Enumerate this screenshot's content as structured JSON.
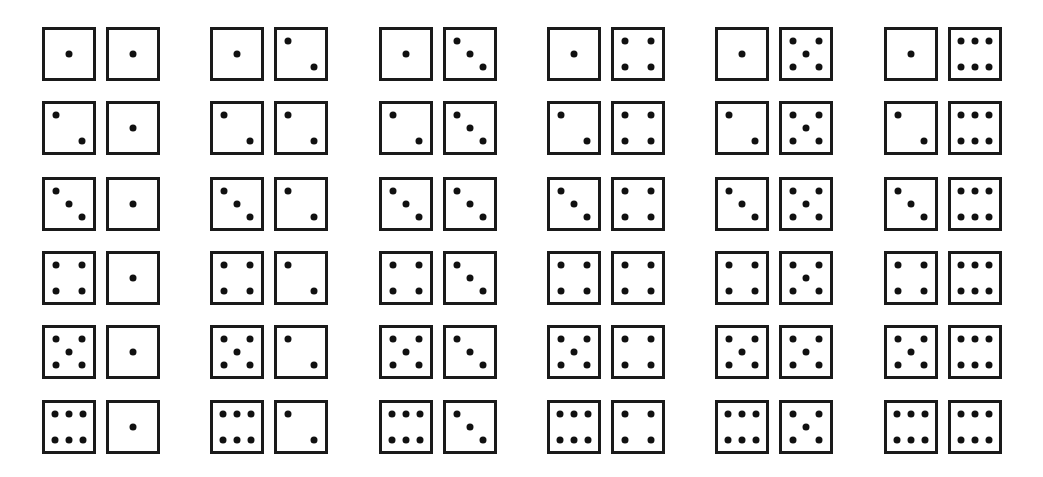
{
  "figure": {
    "rows": 6,
    "cols": 6,
    "ink_color": "#111111",
    "background": "#ffffff",
    "row_y": [
      27,
      101,
      177,
      251,
      325,
      400
    ],
    "col_x": [
      42,
      210,
      379,
      547,
      715,
      884
    ],
    "pairs": [
      [
        [
          1,
          1
        ],
        [
          1,
          2
        ],
        [
          1,
          3
        ],
        [
          1,
          4
        ],
        [
          1,
          5
        ],
        [
          1,
          6
        ]
      ],
      [
        [
          2,
          1
        ],
        [
          2,
          2
        ],
        [
          2,
          3
        ],
        [
          2,
          4
        ],
        [
          2,
          5
        ],
        [
          2,
          6
        ]
      ],
      [
        [
          3,
          1
        ],
        [
          3,
          2
        ],
        [
          3,
          3
        ],
        [
          3,
          4
        ],
        [
          3,
          5
        ],
        [
          3,
          6
        ]
      ],
      [
        [
          4,
          1
        ],
        [
          4,
          2
        ],
        [
          4,
          3
        ],
        [
          4,
          4
        ],
        [
          4,
          5
        ],
        [
          4,
          6
        ]
      ],
      [
        [
          5,
          1
        ],
        [
          5,
          2
        ],
        [
          5,
          3
        ],
        [
          5,
          4
        ],
        [
          5,
          5
        ],
        [
          5,
          6
        ]
      ],
      [
        [
          6,
          1
        ],
        [
          6,
          2
        ],
        [
          6,
          3
        ],
        [
          6,
          4
        ],
        [
          6,
          5
        ],
        [
          6,
          6
        ]
      ]
    ],
    "face_layouts": {
      "1": [
        [
          0.5,
          0.5
        ]
      ],
      "2": [
        [
          0.22,
          0.22
        ],
        [
          0.78,
          0.78
        ]
      ],
      "3": [
        [
          0.22,
          0.22
        ],
        [
          0.5,
          0.5
        ],
        [
          0.78,
          0.78
        ]
      ],
      "4": [
        [
          0.22,
          0.22
        ],
        [
          0.78,
          0.22
        ],
        [
          0.22,
          0.78
        ],
        [
          0.78,
          0.78
        ]
      ],
      "5": [
        [
          0.22,
          0.22
        ],
        [
          0.78,
          0.22
        ],
        [
          0.5,
          0.5
        ],
        [
          0.22,
          0.78
        ],
        [
          0.78,
          0.78
        ]
      ],
      "6": [
        [
          0.2,
          0.22
        ],
        [
          0.5,
          0.22
        ],
        [
          0.8,
          0.22
        ],
        [
          0.2,
          0.78
        ],
        [
          0.5,
          0.78
        ],
        [
          0.8,
          0.78
        ]
      ]
    }
  }
}
